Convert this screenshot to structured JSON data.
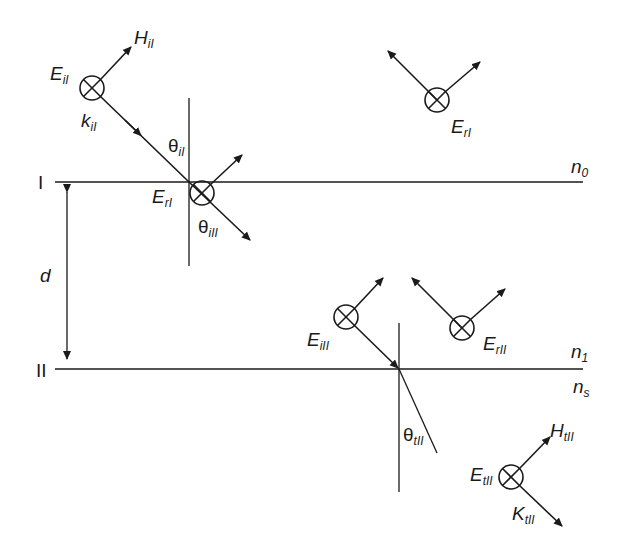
{
  "diagram": {
    "title": "",
    "interfaces": [
      {
        "id": "I",
        "label": "I",
        "y": 182,
        "medium_above": "n",
        "medium_above_sub": "0"
      },
      {
        "id": "II",
        "label": "II",
        "y": 369,
        "medium_above": "n",
        "medium_above_sub": "1",
        "medium_below": "n",
        "medium_below_sub": "s"
      }
    ],
    "thickness_label": "d",
    "fields": {
      "E_iI": {
        "main": "E",
        "sub": "iI"
      },
      "H_iI": {
        "main": "H",
        "sub": "iI"
      },
      "k_iI": {
        "main": "k",
        "sub": "iI"
      },
      "theta_iI": {
        "main": "θ",
        "sub": "iI"
      },
      "E_rI_interface": {
        "main": "E",
        "sub": "rI"
      },
      "theta_iII_interface": {
        "main": "θ",
        "sub": "iII"
      },
      "E_rI_reflected": {
        "main": "E",
        "sub": "rI"
      },
      "E_iII": {
        "main": "E",
        "sub": "iII"
      },
      "E_rII": {
        "main": "E",
        "sub": "rII"
      },
      "theta_tII": {
        "main": "θ",
        "sub": "tII"
      },
      "E_tII": {
        "main": "E",
        "sub": "tII"
      },
      "H_tII": {
        "main": "H",
        "sub": "tII"
      },
      "K_tII": {
        "main": "K",
        "sub": "tII"
      }
    },
    "symbols": {
      "into_page": "circle-with-cross (field pointing into page)"
    },
    "colors": {
      "ink": "#1a1a1a",
      "background": "#ffffff"
    }
  }
}
